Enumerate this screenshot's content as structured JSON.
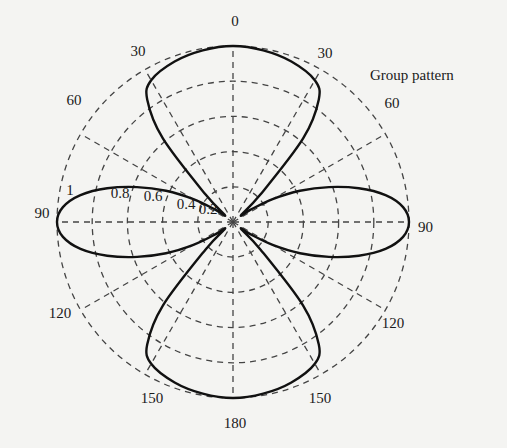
{
  "chart_data": {
    "type": "polar",
    "title": "",
    "legend": [
      {
        "label": "Group pattern",
        "position": "upper-right"
      }
    ],
    "angle_unit": "degrees",
    "angle_zero": "top",
    "angle_direction": "symmetric (both sides labeled 0..180)",
    "angle_ticks": [
      0,
      30,
      60,
      90,
      120,
      150,
      180
    ],
    "angle_tick_labels_right": [
      "0",
      "30",
      "60",
      "90",
      "120",
      "150",
      "180"
    ],
    "angle_tick_labels_left": [
      "30",
      "60",
      "90",
      "120",
      "150"
    ],
    "radial_ticks": [
      0.2,
      0.4,
      0.6,
      0.8,
      1
    ],
    "radial_tick_labels": [
      "0.2",
      "0.4",
      "0.6",
      "0.8",
      "1"
    ],
    "rlim": [
      0,
      1
    ],
    "grid": true,
    "series": [
      {
        "name": "Group pattern",
        "theta_deg": [
          0,
          10,
          20,
          30,
          35,
          40,
          45,
          50,
          55,
          60,
          65,
          70,
          75,
          80,
          85,
          90,
          95,
          100,
          105,
          110,
          115,
          120,
          125,
          130,
          135,
          140,
          145,
          150,
          160,
          170,
          180
        ],
        "r": [
          1.0,
          0.99,
          0.97,
          0.93,
          0.85,
          0.62,
          0.22,
          0.06,
          0.12,
          0.26,
          0.42,
          0.58,
          0.74,
          0.88,
          0.97,
          1.0,
          0.97,
          0.88,
          0.74,
          0.58,
          0.42,
          0.26,
          0.12,
          0.06,
          0.22,
          0.62,
          0.85,
          0.93,
          0.97,
          0.99,
          1.0
        ]
      }
    ]
  },
  "labels": {
    "legend_text": "Group pattern"
  }
}
